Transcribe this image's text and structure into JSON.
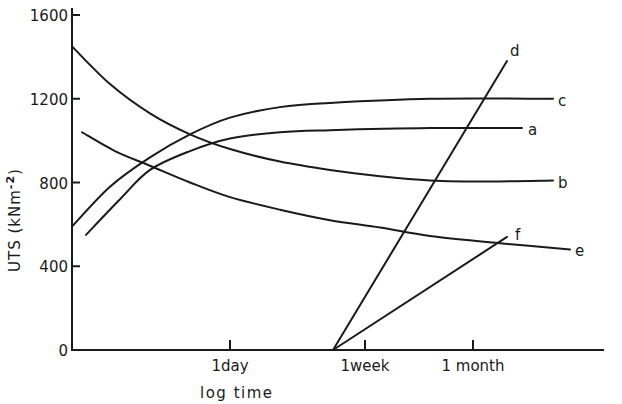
{
  "chart_data": {
    "type": "line",
    "title": "",
    "xlabel": "log time",
    "ylabel": "UTS (kNm^-2)",
    "ylabel_parts": {
      "main": "UTS (kNm",
      "sup": "-2",
      "close": ")"
    },
    "ylim": [
      0,
      1600
    ],
    "yticks": [
      0,
      400,
      800,
      1200,
      1600
    ],
    "ytick_labels": [
      "0",
      "400",
      "800",
      "1200",
      "1600"
    ],
    "xscale": "log",
    "xticks": [
      {
        "label": "1day",
        "px": 230
      },
      {
        "label": "1week",
        "px": 365
      },
      {
        "label": "1 month",
        "px": 473
      }
    ],
    "grid": false,
    "legend": "inline curve labels",
    "series": [
      {
        "name": "a",
        "points": [
          [
            86,
            550
          ],
          [
            120,
            720
          ],
          [
            150,
            860
          ],
          [
            190,
            950
          ],
          [
            230,
            1010
          ],
          [
            280,
            1040
          ],
          [
            330,
            1050
          ],
          [
            430,
            1060
          ],
          [
            522,
            1060
          ]
        ]
      },
      {
        "name": "b",
        "points": [
          [
            72,
            1450
          ],
          [
            110,
            1270
          ],
          [
            150,
            1130
          ],
          [
            190,
            1030
          ],
          [
            230,
            960
          ],
          [
            280,
            900
          ],
          [
            330,
            860
          ],
          [
            380,
            830
          ],
          [
            430,
            810
          ],
          [
            490,
            805
          ],
          [
            553,
            810
          ]
        ]
      },
      {
        "name": "c",
        "points": [
          [
            72,
            590
          ],
          [
            110,
            780
          ],
          [
            150,
            920
          ],
          [
            190,
            1030
          ],
          [
            230,
            1110
          ],
          [
            280,
            1160
          ],
          [
            330,
            1180
          ],
          [
            430,
            1200
          ],
          [
            553,
            1200
          ]
        ]
      },
      {
        "name": "d",
        "points": [
          [
            333,
            0
          ],
          [
            507,
            1380
          ]
        ]
      },
      {
        "name": "e",
        "points": [
          [
            82,
            1040
          ],
          [
            115,
            950
          ],
          [
            150,
            880
          ],
          [
            190,
            800
          ],
          [
            230,
            730
          ],
          [
            280,
            670
          ],
          [
            330,
            620
          ],
          [
            380,
            585
          ],
          [
            430,
            545
          ],
          [
            500,
            510
          ],
          [
            570,
            480
          ]
        ]
      },
      {
        "name": "f",
        "points": [
          [
            333,
            0
          ],
          [
            507,
            540
          ]
        ]
      }
    ],
    "x_units_note": "x given in horizontal pixel position on log-time axis (1day=230, 1week=365, 1month=473)"
  },
  "labels": {
    "a": "a",
    "b": "b",
    "c": "c",
    "d": "d",
    "e": "e",
    "f": "f"
  }
}
